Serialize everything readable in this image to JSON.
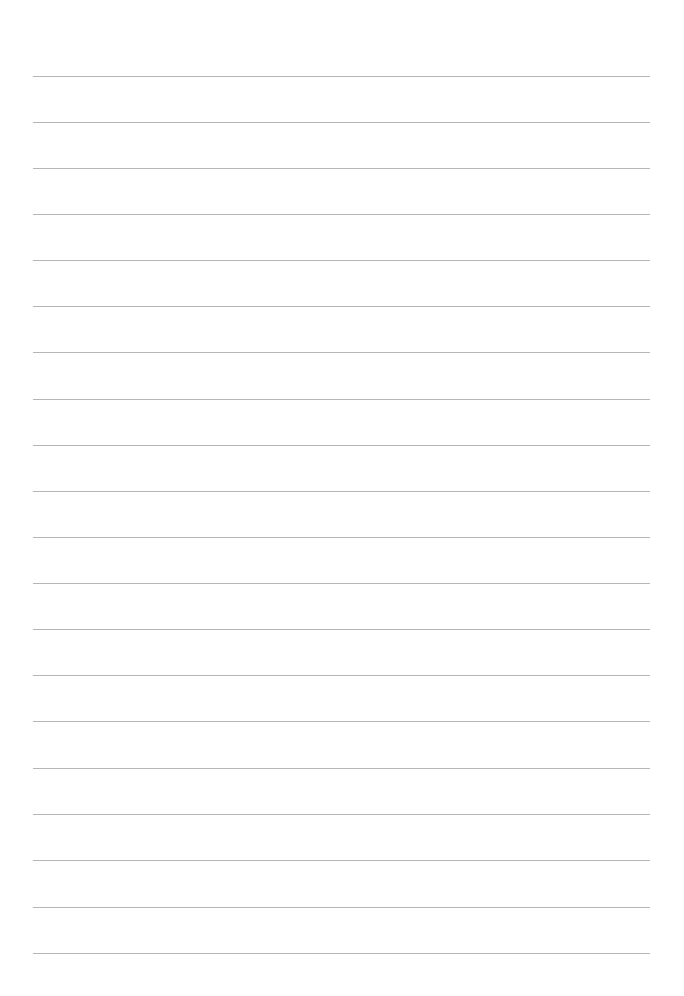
{
  "page": {
    "type": "lined-paper",
    "background_color": "#ffffff",
    "rule_color": "#a9a9a9",
    "rule_count": 20,
    "rule_positions_y": [
      76,
      122,
      168,
      214,
      260,
      306,
      352,
      399,
      445,
      491,
      537,
      583,
      629,
      675,
      721,
      768,
      814,
      860,
      907,
      953
    ]
  }
}
